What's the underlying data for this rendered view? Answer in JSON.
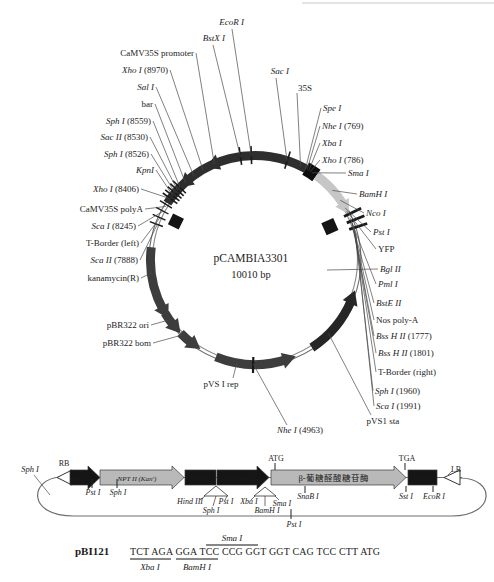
{
  "plasmid": {
    "title": "pCAMBIA3301",
    "size_label": "10010 bp",
    "cx": 255,
    "cy": 260,
    "r": 104,
    "arcs": [
      {
        "name": "bar-35S-promoter-region-arc",
        "from": 303,
        "to": 389,
        "w": 9,
        "color": "#2e2e2e"
      },
      {
        "name": "mcs-35S-block",
        "from": 389,
        "to": 396,
        "w": 14,
        "color": "#0d0d0d"
      },
      {
        "name": "yfp-arc",
        "from": 36,
        "to": 57,
        "w": 9,
        "color": "#c6c6c6"
      },
      {
        "name": "pvs1-sta-arc",
        "from": 113,
        "to": 147,
        "w": 9,
        "color": "#262626"
      },
      {
        "name": "pvs1-rep-arc",
        "from": 162,
        "to": 202,
        "w": 9,
        "color": "#3d3d3d"
      },
      {
        "name": "kanamycin-arc",
        "from": 241,
        "to": 277,
        "w": 9,
        "color": "#3d3d3d"
      },
      {
        "name": "pbr322-ori-arc",
        "from": 231,
        "to": 239.5,
        "w": 9,
        "color": "#3d3d3d"
      },
      {
        "name": "pbr322-bom-arc",
        "from": 217,
        "to": 225.5,
        "w": 9,
        "color": "#3d3d3d"
      }
    ],
    "arrows": [
      {
        "name": "bar-arrow-1",
        "a": 320,
        "dir": "ccw",
        "color": "#2e2e2e"
      },
      {
        "name": "bar-arrow-2",
        "a": 338,
        "dir": "ccw",
        "color": "#2e2e2e"
      },
      {
        "name": "yfp-arrow",
        "a": 58,
        "dir": "cw",
        "color": "#c6c6c6"
      },
      {
        "name": "pvs1-sta-arrow",
        "a": 113,
        "dir": "ccw",
        "color": "#262626"
      },
      {
        "name": "pvs1-rep-arrow",
        "a": 163,
        "dir": "ccw",
        "color": "#3d3d3d"
      },
      {
        "name": "kanamycin-arrow",
        "a": 242,
        "dir": "ccw",
        "color": "#3d3d3d"
      },
      {
        "name": "pbr322-ori-arrow",
        "a": 231.5,
        "dir": "ccw",
        "color": "#3d3d3d"
      },
      {
        "name": "pbr322-bom-arrow",
        "a": 217.5,
        "dir": "ccw",
        "color": "#3d3d3d"
      }
    ],
    "ticks": [
      {
        "a": 290,
        "r1": 98,
        "r2": 112,
        "w": 1.4
      },
      {
        "a": 294,
        "r1": 98,
        "r2": 112,
        "w": 1.4
      },
      {
        "a": 298,
        "r1": 98,
        "r2": 112,
        "w": 1.4
      },
      {
        "a": 302,
        "r1": 98,
        "r2": 112,
        "w": 1.4
      },
      {
        "a": 306,
        "r1": 96,
        "r2": 114,
        "w": 1.6
      },
      {
        "a": 308,
        "r1": 96,
        "r2": 114,
        "w": 1.6
      },
      {
        "a": 310,
        "r1": 96,
        "r2": 114,
        "w": 1.6
      },
      {
        "a": 312,
        "r1": 96,
        "r2": 114,
        "w": 1.6
      },
      {
        "a": 314,
        "r1": 96,
        "r2": 114,
        "w": 1.6
      },
      {
        "a": 352,
        "r1": 96,
        "r2": 114,
        "w": 1.6
      },
      {
        "a": 358,
        "r1": 96,
        "r2": 114,
        "w": 1.6
      },
      {
        "a": 18,
        "r1": 96,
        "r2": 114,
        "w": 1.6
      },
      {
        "a": 64,
        "r1": 99,
        "r2": 118,
        "w": 2.8
      },
      {
        "a": 68,
        "r1": 99,
        "r2": 118,
        "w": 2.8
      },
      {
        "a": 72,
        "r1": 99,
        "r2": 118,
        "w": 2.8
      },
      {
        "a": 181,
        "r1": 97,
        "r2": 113,
        "w": 2.2
      }
    ],
    "squares": [
      {
        "name": "camv-polya-square",
        "a": 296,
        "r": 88,
        "s": 12
      },
      {
        "name": "nos-polya-square",
        "a": 66,
        "r": 82,
        "s": 13
      }
    ],
    "sites": [
      {
        "name": "EcoR I",
        "pos": "",
        "x": 244,
        "y": 25,
        "anchor": "end",
        "angle": 358,
        "it": true,
        "sx": 232,
        "sy": 29
      },
      {
        "name": "BstX I",
        "pos": "",
        "x": 225,
        "y": 41,
        "anchor": "end",
        "angle": 352,
        "it": true,
        "sx": 213,
        "sy": 45
      },
      {
        "name": "Sac I",
        "pos": "",
        "x": 289,
        "y": 74,
        "anchor": "end",
        "angle": 18,
        "it": true,
        "sx": 276,
        "sy": 78
      },
      {
        "name": "CaMV35S promoter",
        "pos": "",
        "x": 194,
        "y": 56,
        "anchor": "end",
        "angle": 337,
        "it": false
      },
      {
        "name": "Xho I",
        "pos": "(8970)",
        "x": 168,
        "y": 73,
        "anchor": "end",
        "angle": 330,
        "it": true
      },
      {
        "name": "Sal I",
        "pos": "",
        "x": 154,
        "y": 90,
        "anchor": "end",
        "angle": 324,
        "it": true
      },
      {
        "name": "bar",
        "pos": "",
        "x": 153,
        "y": 107,
        "anchor": "end",
        "angle": 318,
        "it": false
      },
      {
        "name": "Sph I",
        "pos": "(8559)",
        "x": 151,
        "y": 124,
        "anchor": "end",
        "angle": 314,
        "it": true
      },
      {
        "name": "Sac II",
        "pos": "(8530)",
        "x": 148,
        "y": 140,
        "anchor": "end",
        "angle": 312,
        "it": true
      },
      {
        "name": "Sph I",
        "pos": "(8526)",
        "x": 149,
        "y": 157,
        "anchor": "end",
        "angle": 310,
        "it": true
      },
      {
        "name": "KpnI",
        "pos": "",
        "x": 154,
        "y": 173,
        "anchor": "end",
        "angle": 308,
        "it": true
      },
      {
        "name": "Xho I",
        "pos": "(8406)",
        "x": 139,
        "y": 192,
        "anchor": "end",
        "angle": 306,
        "it": true
      },
      {
        "name": "CaMV35S polyA",
        "pos": "",
        "x": 143,
        "y": 212,
        "anchor": "end",
        "angle": 301,
        "it": false
      },
      {
        "name": "Sca I",
        "pos": "(8245)",
        "x": 136,
        "y": 229,
        "anchor": "end",
        "angle": 298,
        "it": true
      },
      {
        "name": "T-Border (left)",
        "pos": "",
        "x": 139,
        "y": 246,
        "anchor": "end",
        "angle": 294,
        "it": false
      },
      {
        "name": "Sca II",
        "pos": "(7888)",
        "x": 138,
        "y": 263,
        "anchor": "end",
        "angle": 290,
        "it": true
      },
      {
        "name": "kanamycin(R)",
        "pos": "",
        "x": 139,
        "y": 281,
        "anchor": "end",
        "angle": 263,
        "it": false
      },
      {
        "name": "pBR322 ori",
        "pos": "",
        "x": 149,
        "y": 328,
        "anchor": "end",
        "angle": 235,
        "it": false
      },
      {
        "name": "pBR322 bom",
        "pos": "",
        "x": 151,
        "y": 346,
        "anchor": "end",
        "angle": 224,
        "it": false
      },
      {
        "name": "pVS I rep",
        "pos": "",
        "x": 221,
        "y": 387,
        "anchor": "middle",
        "angle": 190,
        "it": false,
        "sx": 233,
        "sy": 378
      },
      {
        "name": "Nhe I",
        "pos": "(4963)",
        "x": 300,
        "y": 433,
        "anchor": "middle",
        "angle": 181,
        "it": true,
        "sx": 287,
        "sy": 425
      },
      {
        "name": "pVS1 sta",
        "pos": "",
        "x": 383,
        "y": 424,
        "anchor": "middle",
        "angle": 135,
        "it": false,
        "sx": 371,
        "sy": 415
      },
      {
        "name": "Sca I",
        "pos": "(1991)",
        "x": 376,
        "y": 409,
        "anchor": "start",
        "angle": 76,
        "it": true
      },
      {
        "name": "Sph I",
        "pos": "(1960)",
        "x": 375,
        "y": 394,
        "anchor": "start",
        "angle": 74.5,
        "it": true
      },
      {
        "name": "T-Border (right)",
        "pos": "",
        "x": 378,
        "y": 375,
        "anchor": "start",
        "angle": 73,
        "it": false
      },
      {
        "name": "Bss H II",
        "pos": "(1801)",
        "x": 378,
        "y": 356,
        "anchor": "start",
        "angle": 71,
        "it": true
      },
      {
        "name": "Bss H II",
        "pos": "(1777)",
        "x": 376,
        "y": 339,
        "anchor": "start",
        "angle": 70,
        "it": true
      },
      {
        "name": "Nos poly-A",
        "pos": "",
        "x": 376,
        "y": 323,
        "anchor": "start",
        "angle": 69,
        "it": false
      },
      {
        "name": "BstE II",
        "pos": "",
        "x": 376,
        "y": 306,
        "anchor": "start",
        "angle": 68,
        "it": true
      },
      {
        "name": "Pml I",
        "pos": "",
        "x": 378,
        "y": 287,
        "anchor": "start",
        "angle": 66,
        "it": true
      },
      {
        "name": "Bgl II",
        "pos": "",
        "x": 380,
        "y": 272,
        "anchor": "start",
        "angle": 95,
        "it": true,
        "sx": 378,
        "sy": 269,
        "tx": 327,
        "ty": 270
      },
      {
        "name": "YFP",
        "pos": "",
        "x": 378,
        "y": 252,
        "anchor": "start",
        "angle": 62,
        "it": false
      },
      {
        "name": "Pst I",
        "pos": "",
        "x": 373,
        "y": 235,
        "anchor": "start",
        "angle": 60,
        "it": true
      },
      {
        "name": "Nco I",
        "pos": "",
        "x": 366,
        "y": 216,
        "anchor": "start",
        "angle": 55,
        "it": true
      },
      {
        "name": "BamH I",
        "pos": "",
        "x": 359,
        "y": 197,
        "anchor": "start",
        "angle": 48,
        "it": true
      },
      {
        "name": "Sma I",
        "pos": "",
        "x": 348,
        "y": 176,
        "anchor": "start",
        "angle": 33,
        "it": true
      },
      {
        "name": "Xho I",
        "pos": "(786)",
        "x": 322,
        "y": 163,
        "anchor": "start",
        "angle": 32,
        "it": true
      },
      {
        "name": "Xba I",
        "pos": "",
        "x": 322,
        "y": 146,
        "anchor": "start",
        "angle": 31,
        "it": true
      },
      {
        "name": "Nhe I",
        "pos": "(769)",
        "x": 322,
        "y": 129,
        "anchor": "start",
        "angle": 30,
        "it": true
      },
      {
        "name": "Spe I",
        "pos": "",
        "x": 323,
        "y": 111,
        "anchor": "start",
        "angle": 29,
        "it": true
      },
      {
        "name": "35S",
        "pos": "",
        "x": 298,
        "y": 91,
        "anchor": "start",
        "angle": 26,
        "it": false,
        "sx": 297,
        "sy": 93
      }
    ]
  },
  "construct": {
    "backbone_path": "M 60 477 C 30 479 26 516 74 516 L 452 516 C 496 516 496 478 460 478",
    "topline": {
      "x1": 58,
      "y": 477.5,
      "x2": 462
    },
    "elements": [
      {
        "type": "otri",
        "name": "right-border-RB-triangle",
        "x1": 57,
        "x2": 72,
        "color": "#ffffff",
        "text": "",
        "tcolor": "",
        "fs": 0,
        "italic": false
      },
      {
        "type": "arrow",
        "name": "nos-promoter-arrow",
        "x1": 70,
        "x2": 100,
        "color": "#151515",
        "text": "NOS-pro",
        "tcolor": "#ffffff",
        "fs": 5,
        "italic": true
      },
      {
        "type": "arrow",
        "name": "nptII-kan-arrow",
        "x1": 100,
        "x2": 184,
        "color": "#b9b9b9",
        "text": "NPT II (Kanʳ)",
        "tcolor": "#1c1c1c",
        "fs": 7,
        "italic": true
      },
      {
        "type": "box",
        "name": "nos-terminator-box-1",
        "x1": 185,
        "x2": 216,
        "color": "#151515",
        "text": "NOS-ter",
        "tcolor": "#ffffff",
        "fs": 5.5,
        "italic": true
      },
      {
        "type": "arrow",
        "name": "camv-35s-promoter-arrow",
        "x1": 217,
        "x2": 269,
        "color": "#151515",
        "text": "CaMV 35S promoter",
        "tcolor": "#ffffff",
        "fs": 5,
        "italic": false
      },
      {
        "type": "arrow",
        "name": "gus-gene-arrow",
        "x1": 271,
        "x2": 406,
        "color": "#b9b9b9",
        "text": "β-葡糖醛酸糖苷酶",
        "tcolor": "#1c1c1c",
        "fs": 8.5,
        "italic": false
      },
      {
        "type": "box",
        "name": "nos-terminator-box-2",
        "x1": 408,
        "x2": 437,
        "color": "#151515",
        "text": "NOS-ter",
        "tcolor": "#ffffff",
        "fs": 5.5,
        "italic": true
      },
      {
        "type": "otri",
        "name": "left-border-LB-triangle",
        "x1": 444,
        "x2": 460,
        "color": "#ffffff",
        "text": "",
        "tcolor": "",
        "fs": 0,
        "italic": false
      }
    ],
    "ticks": [
      {
        "x": 92,
        "y1": 479,
        "y2": 488
      },
      {
        "x": 117,
        "y1": 479,
        "y2": 488
      },
      {
        "x": 275,
        "y1": 463,
        "y2": 470
      },
      {
        "x": 405,
        "y1": 463,
        "y2": 470
      },
      {
        "x": 305,
        "y1": 486,
        "y2": 493
      },
      {
        "x": 406,
        "y1": 486,
        "y2": 492
      },
      {
        "x": 433,
        "y1": 486,
        "y2": 492
      },
      {
        "x": 291,
        "y1": 509,
        "y2": 519
      }
    ],
    "labels": [
      {
        "text": "Sph I",
        "x": 30,
        "y": 472,
        "it": true,
        "fs": 8.5
      },
      {
        "text": "RB",
        "x": 64,
        "y": 466,
        "it": false,
        "fs": 8
      },
      {
        "text": "LB",
        "x": 456,
        "y": 472,
        "it": false,
        "fs": 8
      },
      {
        "text": "ATG",
        "x": 276,
        "y": 461,
        "it": false,
        "fs": 8
      },
      {
        "text": "TGA",
        "x": 407,
        "y": 461,
        "it": false,
        "fs": 8
      },
      {
        "text": "Pst I",
        "x": 93,
        "y": 495,
        "it": true,
        "fs": 8
      },
      {
        "text": "Sph I",
        "x": 118,
        "y": 495,
        "it": true,
        "fs": 8
      },
      {
        "text": "Hind III",
        "x": 190,
        "y": 504,
        "it": true,
        "fs": 8
      },
      {
        "text": "Sph I",
        "x": 211,
        "y": 513,
        "it": true,
        "fs": 8
      },
      {
        "text": "Pst I",
        "x": 226,
        "y": 504,
        "it": true,
        "fs": 8
      },
      {
        "text": "Xba I",
        "x": 249,
        "y": 504,
        "it": true,
        "fs": 8
      },
      {
        "text": "BamH I",
        "x": 267,
        "y": 513,
        "it": true,
        "fs": 8
      },
      {
        "text": "Sma I",
        "x": 282,
        "y": 506,
        "it": true,
        "fs": 8
      },
      {
        "text": "SnaB I",
        "x": 308,
        "y": 499,
        "it": true,
        "fs": 8
      },
      {
        "text": "Sst I",
        "x": 406,
        "y": 499,
        "it": true,
        "fs": 8
      },
      {
        "text": "EcoR I",
        "x": 434,
        "y": 499,
        "it": true,
        "fs": 8
      },
      {
        "text": "Pst I",
        "x": 294,
        "y": 527,
        "it": true,
        "fs": 8
      }
    ],
    "fans": [
      {
        "pts": "204,496 228,496 216,486",
        "stems": [
          [
            205,
            496,
            200,
            500
          ],
          [
            216,
            496,
            213,
            506
          ],
          [
            227,
            496,
            225,
            500
          ]
        ]
      },
      {
        "pts": "254,496 276,496 265,487",
        "stems": [
          [
            255,
            496,
            251,
            500
          ],
          [
            265,
            496,
            265,
            506
          ],
          [
            275,
            496,
            279,
            500
          ]
        ]
      }
    ],
    "leaders": [
      [
        34,
        475,
        50,
        495
      ],
      [
        452,
        471,
        448,
        475
      ]
    ]
  },
  "sequence": {
    "construct_name": "pBI121",
    "seq": "TCT AGA GGA TCC CCG GGT GGT CAG TCC CTT ATG",
    "lines": [
      {
        "x1": 130,
        "y1": 559,
        "x2": 171,
        "y2": 559
      },
      {
        "x1": 176,
        "y1": 559,
        "x2": 218,
        "y2": 559
      },
      {
        "x1": 206,
        "y1": 545,
        "x2": 258,
        "y2": 545
      }
    ],
    "labels": [
      {
        "text": "Sma I",
        "x": 232,
        "y": 541,
        "it": true
      },
      {
        "text": "Xba I",
        "x": 150,
        "y": 570,
        "it": true
      },
      {
        "text": "BamH I",
        "x": 197,
        "y": 570,
        "it": true
      }
    ]
  }
}
